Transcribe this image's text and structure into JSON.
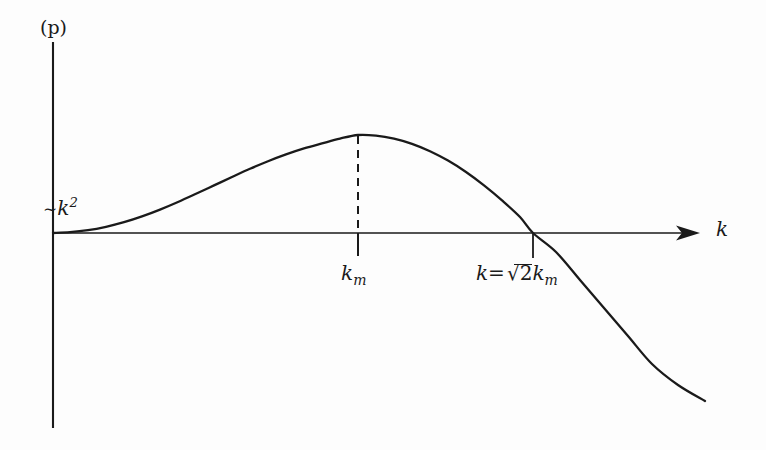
{
  "figure": {
    "kind": "line-plot",
    "background_color": "#fdfdfd",
    "ink_color": "#1a1a1a"
  },
  "labels": {
    "y_axis": "(p)",
    "x_axis": "k",
    "small_k_asymptote_tilde": "∼",
    "small_k_asymptote_base": "k",
    "small_k_asymptote_exponent": "2",
    "peak_tick": "k",
    "peak_tick_subscript": "m",
    "zero_crossing_prefix": "k=",
    "zero_crossing_radicand": "2",
    "zero_crossing_base": "k",
    "zero_crossing_subscript": "m"
  },
  "chart_data": {
    "type": "line",
    "title": "",
    "xlabel": "k",
    "ylabel": "(p)",
    "grid": false,
    "legend": null,
    "axis_style": {
      "x_axis_arrow": true,
      "y_axis_arrow": false,
      "x_axis_pixel_y": 233,
      "y_axis_pixel_x": 53,
      "x_axis_start_px": 53,
      "x_axis_end_px": 700,
      "y_axis_top_px": 42,
      "y_axis_bottom_px": 428
    },
    "annotations": [
      {
        "name": "small-k-scaling",
        "text": "~k^2",
        "meaning": "growth rate rises quadratically for small k",
        "x_px": 43,
        "y_px": 196
      },
      {
        "name": "peak-wavenumber",
        "text": "k_m",
        "meaning": "wavenumber of maximum growth rate",
        "x_px": 358,
        "y_px": 263
      },
      {
        "name": "marginal-wavenumber",
        "text": "k = sqrt(2) k_m",
        "meaning": "wavenumber where growth rate returns to zero",
        "x_px": 533,
        "y_px": 263
      }
    ],
    "markers": {
      "peak": {
        "x_px": 358,
        "y_px": 135,
        "dashed_dropline": true
      },
      "zero_crossing": {
        "x_px": 533,
        "y_px": 233
      }
    },
    "curve_points_px": [
      [
        53,
        233
      ],
      [
        70,
        232.2
      ],
      [
        88,
        230.2
      ],
      [
        106,
        226.8
      ],
      [
        124,
        222.2
      ],
      [
        142,
        216.4
      ],
      [
        160,
        209.6
      ],
      [
        178,
        202.0
      ],
      [
        196,
        193.8
      ],
      [
        214,
        185.4
      ],
      [
        232,
        177.0
      ],
      [
        250,
        168.8
      ],
      [
        268,
        161.2
      ],
      [
        286,
        154.4
      ],
      [
        304,
        148.4
      ],
      [
        322,
        143.4
      ],
      [
        340,
        138.6
      ],
      [
        358,
        135.0
      ],
      [
        376,
        135.6
      ],
      [
        394,
        138.6
      ],
      [
        412,
        143.8
      ],
      [
        430,
        151.2
      ],
      [
        448,
        160.6
      ],
      [
        466,
        172.0
      ],
      [
        484,
        185.4
      ],
      [
        502,
        200.4
      ],
      [
        520,
        217.0
      ],
      [
        533,
        233.0
      ],
      [
        556,
        252.0
      ],
      [
        580,
        280.0
      ],
      [
        604,
        308.0
      ],
      [
        628,
        336.0
      ],
      [
        652,
        364.0
      ],
      [
        678,
        385.0
      ],
      [
        705,
        401.0
      ]
    ]
  }
}
